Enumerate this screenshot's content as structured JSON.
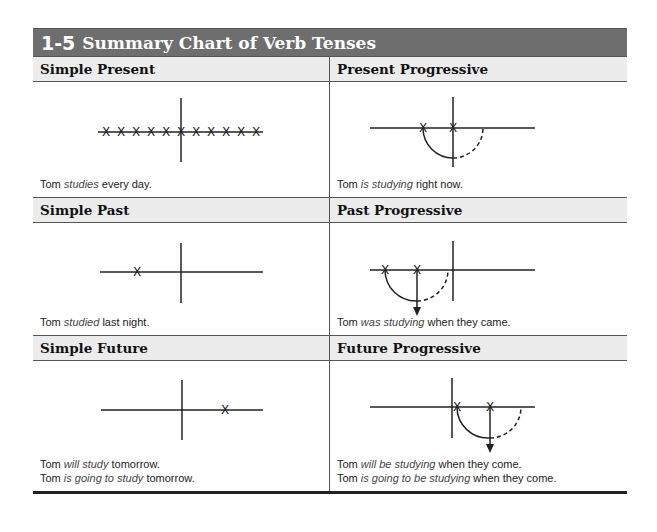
{
  "section": {
    "number": "1-5",
    "title": "Summary Chart of Verb Tenses"
  },
  "cells": {
    "simple_present": {
      "heading": "Simple Present",
      "examples": [
        {
          "before": "Tom ",
          "verb": "studies",
          "after": " every day."
        }
      ],
      "diagram": {
        "type": "repeated-points",
        "points": 11,
        "now_marker": true
      }
    },
    "present_progressive": {
      "heading": "Present Progressive",
      "examples": [
        {
          "before": "Tom ",
          "verb": "is studying",
          "after": " right now."
        }
      ],
      "diagram": {
        "type": "progressive-arc",
        "anchor": "now"
      }
    },
    "simple_past": {
      "heading": "Simple Past",
      "examples": [
        {
          "before": "Tom ",
          "verb": "studied",
          "after": " last night."
        }
      ],
      "diagram": {
        "type": "single-point",
        "position": "past"
      }
    },
    "past_progressive": {
      "heading": "Past Progressive",
      "examples": [
        {
          "before": "Tom ",
          "verb": "was studying",
          "after": " when they came."
        }
      ],
      "diagram": {
        "type": "progressive-arc-arrow",
        "anchor": "past"
      }
    },
    "simple_future": {
      "heading": "Simple Future",
      "examples": [
        {
          "before": "Tom ",
          "verb": "will study",
          "after": " tomorrow."
        },
        {
          "before": "Tom ",
          "verb": "is going to study",
          "after": " tomorrow."
        }
      ],
      "diagram": {
        "type": "single-point",
        "position": "future"
      }
    },
    "future_progressive": {
      "heading": "Future Progressive",
      "examples": [
        {
          "before": "Tom ",
          "verb": "will be studying",
          "after": " when they come."
        },
        {
          "before": "Tom ",
          "verb": "is going to be studying",
          "after": " when they come."
        }
      ],
      "diagram": {
        "type": "progressive-arc-arrow",
        "anchor": "future"
      }
    }
  },
  "marker_glyph": "X"
}
